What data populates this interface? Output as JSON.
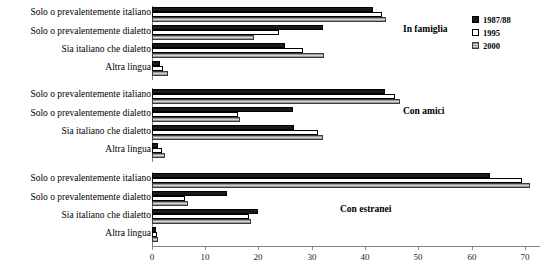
{
  "chart_data": {
    "type": "bar",
    "orientation": "horizontal",
    "title": "",
    "xlabel": "",
    "ylabel": "",
    "xlim": [
      0,
      75
    ],
    "xticks": [
      0,
      10,
      20,
      30,
      40,
      50,
      60,
      70
    ],
    "grid": false,
    "legend_position": "top-right",
    "series_names": [
      "1987/88",
      "1995",
      "2000"
    ],
    "categories": [
      "Solo o prevalentemente italiano",
      "Solo o prevalentemente dialetto",
      "Sia italiano che dialetto",
      "Altra lingua"
    ],
    "panels": [
      {
        "title": "In famiglia",
        "series": [
          {
            "name": "1987/88",
            "values": [
              41.5,
              32.0,
              24.9,
              1.5
            ]
          },
          {
            "name": "1995",
            "values": [
              43.2,
              23.8,
              28.3,
              2.0
            ]
          },
          {
            "name": "2000",
            "values": [
              44.0,
              19.1,
              32.2,
              3.0
            ]
          }
        ]
      },
      {
        "title": "Con amici",
        "series": [
          {
            "name": "1987/88",
            "values": [
              43.7,
              26.5,
              26.6,
              1.2
            ]
          },
          {
            "name": "1995",
            "values": [
              45.6,
              16.2,
              31.1,
              1.8
            ]
          },
          {
            "name": "2000",
            "values": [
              46.5,
              16.5,
              32.1,
              2.5
            ]
          }
        ]
      },
      {
        "title": "Con estranei",
        "series": [
          {
            "name": "1987/88",
            "values": [
              63.4,
              14.1,
              19.9,
              0.8
            ]
          },
          {
            "name": "1995",
            "values": [
              69.5,
              6.2,
              18.2,
              1.0
            ]
          },
          {
            "name": "2000",
            "values": [
              71.0,
              6.8,
              18.6,
              1.2
            ]
          }
        ]
      }
    ]
  },
  "legend": {
    "items": [
      {
        "label": "1987/88",
        "swatch": "black-solid-swatch"
      },
      {
        "label": "1995",
        "swatch": "white-open-swatch"
      },
      {
        "label": "2000",
        "swatch": "gray-hatched-swatch"
      }
    ]
  },
  "axis": {
    "tick_labels": [
      "0",
      "10",
      "20",
      "30",
      "40",
      "50",
      "60",
      "70"
    ]
  }
}
